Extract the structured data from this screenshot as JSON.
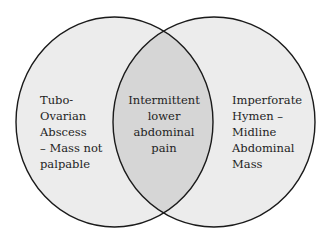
{
  "diagram": {
    "type": "venn",
    "sets": [
      {
        "id": "left",
        "label_lines": [
          "Tubo-",
          "Ovarian",
          "Abscess",
          "– Mass not",
          "palpable"
        ]
      },
      {
        "id": "right",
        "label_lines": [
          "Imperforate",
          "Hymen –",
          "Midline",
          "Abdominal",
          "Mass"
        ]
      }
    ],
    "intersection": {
      "label_lines": [
        "Intermittent",
        "lower",
        "abdominal",
        "pain"
      ]
    },
    "colors": {
      "circle_fill": "#ececec",
      "intersection_fill": "#d6d6d6",
      "outline": "#1a1a1a",
      "background": "#ffffff",
      "text": "#1e1e1e"
    }
  }
}
